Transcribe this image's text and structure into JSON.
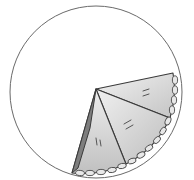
{
  "illustration": {
    "subject": "circle with three pie wedges",
    "colors": {
      "background": "#ffffff",
      "outline": "#3a3a3a",
      "circle_stroke": "#6a6a6a",
      "wedge_light": "#e4e4e4",
      "wedge_mid": "#cfcfcf",
      "wedge_dark": "#8a8a8a"
    },
    "circle": {
      "cx": 96,
      "cy": 92,
      "r": 86
    },
    "wedge_count": 3
  }
}
